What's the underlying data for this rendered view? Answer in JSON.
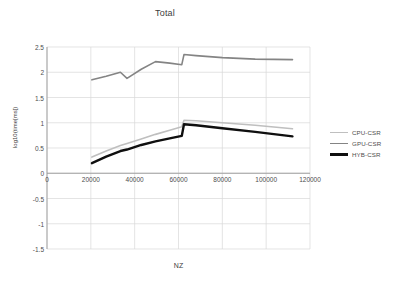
{
  "chart_data": {
    "type": "line",
    "title": "Total",
    "xlabel": "NZ",
    "ylabel": "log10(time[ms])",
    "xlim": [
      0,
      120000
    ],
    "ylim": [
      -1.5,
      2.5
    ],
    "xticks": [
      0,
      20000,
      40000,
      60000,
      80000,
      100000,
      120000
    ],
    "xtick_labels": [
      "0",
      "20000",
      "40000",
      "60000",
      "80000",
      "100000",
      "120000"
    ],
    "yticks": [
      -1.5,
      -1,
      -0.5,
      0,
      0.5,
      1,
      1.5,
      2,
      2.5
    ],
    "ytick_labels": [
      "-1.5",
      "-1",
      "-0.5",
      "0",
      "0.5",
      "1",
      "1.5",
      "2",
      "2.5"
    ],
    "grid": true,
    "grid_color": "#d9d9d9",
    "legend_position": "right",
    "x_axis_crosses_y_at": 0,
    "series": [
      {
        "name": "CPU-CSR",
        "color": "#bfbfbf",
        "width": 1.6,
        "x": [
          20500,
          27000,
          33500,
          36500,
          43000,
          49500,
          56000,
          61500,
          62500,
          68000,
          80000,
          95000,
          112000
        ],
        "values": [
          0.32,
          0.44,
          0.55,
          0.59,
          0.68,
          0.77,
          0.85,
          0.92,
          1.05,
          1.04,
          1.0,
          0.95,
          0.88
        ]
      },
      {
        "name": "GPU-CSR",
        "color": "#848484",
        "width": 1.6,
        "x": [
          20500,
          27000,
          33500,
          36500,
          43000,
          49500,
          56000,
          61500,
          62500,
          68000,
          80000,
          95000,
          112000
        ],
        "values": [
          1.85,
          1.92,
          2.0,
          1.88,
          2.06,
          2.21,
          2.18,
          2.15,
          2.35,
          2.33,
          2.29,
          2.26,
          2.25
        ]
      },
      {
        "name": "HYB-CSR",
        "color": "#0f0f0f",
        "width": 2.4,
        "x": [
          20500,
          27000,
          33500,
          36500,
          43000,
          49500,
          56000,
          61500,
          62500,
          68000,
          80000,
          95000,
          112000
        ],
        "values": [
          0.2,
          0.33,
          0.44,
          0.47,
          0.56,
          0.63,
          0.69,
          0.74,
          0.97,
          0.95,
          0.89,
          0.82,
          0.73
        ]
      }
    ]
  }
}
